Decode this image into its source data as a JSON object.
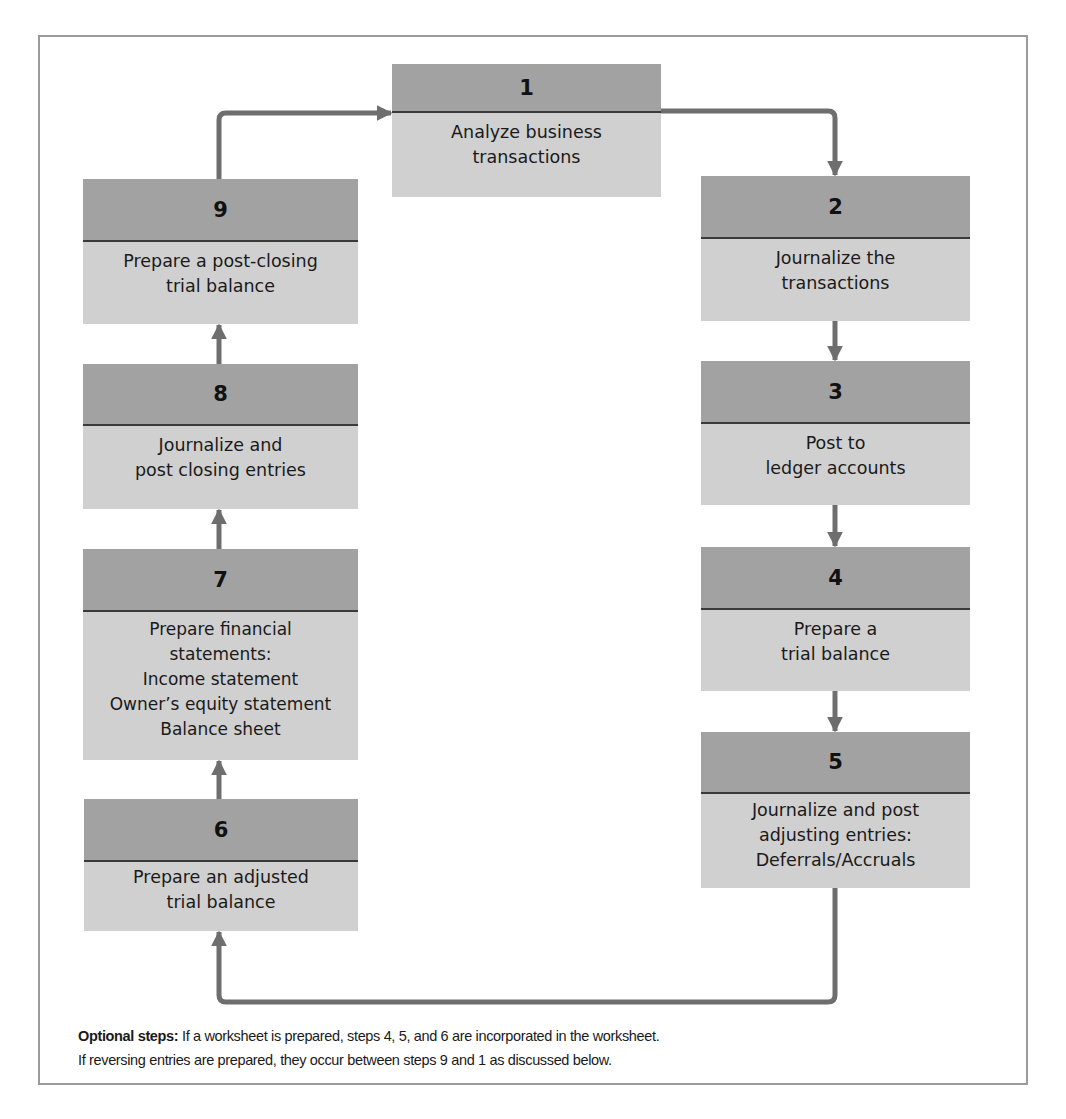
{
  "diagram": {
    "type": "accounting-cycle-flowchart",
    "colors": {
      "header_band": "#a2a2a2",
      "body_band": "#d0d0d0",
      "divider": "#3a3a3a",
      "arrow": "#6e6e6e",
      "frame": "#9a9a9a"
    },
    "steps": [
      {
        "number": "1",
        "lines": [
          "Analyze business",
          "transactions"
        ]
      },
      {
        "number": "2",
        "lines": [
          "Journalize the",
          "transactions"
        ]
      },
      {
        "number": "3",
        "lines": [
          "Post to",
          "ledger accounts"
        ]
      },
      {
        "number": "4",
        "lines": [
          "Prepare a",
          "trial balance"
        ]
      },
      {
        "number": "5",
        "lines": [
          "Journalize and post",
          "adjusting entries:",
          "Deferrals/Accruals"
        ]
      },
      {
        "number": "6",
        "lines": [
          "Prepare an adjusted",
          "trial balance"
        ]
      },
      {
        "number": "7",
        "lines": [
          "Prepare financial",
          "statements:",
          "Income statement",
          "Owner’s equity statement",
          "Balance sheet"
        ]
      },
      {
        "number": "8",
        "lines": [
          "Journalize and",
          "post closing entries"
        ]
      },
      {
        "number": "9",
        "lines": [
          "Prepare a post-closing",
          "trial balance"
        ]
      }
    ],
    "flow": [
      "1→2",
      "2→3",
      "3→4",
      "4→5",
      "5→6",
      "6→7",
      "7→8",
      "8→9",
      "9→1"
    ],
    "note": {
      "label": "Optional steps:",
      "line1": " If a worksheet is prepared, steps 4, 5, and 6 are incorporated in the worksheet.",
      "line2": "If reversing entries are prepared, they occur between steps 9 and 1 as discussed below."
    }
  }
}
